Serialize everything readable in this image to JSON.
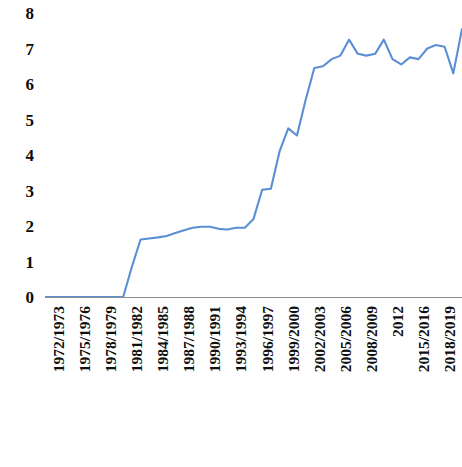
{
  "chart_data": {
    "type": "line",
    "title": "",
    "subtitle": "",
    "xlabel": "",
    "ylabel": "",
    "ylim": [
      0,
      8
    ],
    "y_ticks": [
      0,
      1,
      2,
      3,
      4,
      5,
      6,
      7,
      8
    ],
    "grid": false,
    "legend": false,
    "legend_position": "none",
    "line_color": "#5B8FD4",
    "axis_color": "#8E8E8E",
    "tick_label_color": "#101010",
    "x_tick_labels": [
      "1972/1973",
      "1975/1976",
      "1978/1979",
      "1981/1982",
      "1984/1985",
      "1987/1988",
      "1990/1991",
      "1993/1994",
      "1996/1997",
      "1999/2000",
      "2002/2003",
      "2005/2006",
      "2008/2009",
      "2012",
      "2015/2016",
      "2018/2019",
      "EXERCICE 2021-22"
    ],
    "categories": [
      "1972/1973",
      "1973/1974",
      "1974/1975",
      "1975/1976",
      "1976/1977",
      "1977/1978",
      "1978/1979",
      "1979/1980",
      "1980/1981",
      "1981/1982",
      "1982/1983",
      "1983/1984",
      "1984/1985",
      "1985/1986",
      "1986/1987",
      "1987/1988",
      "1988/1989",
      "1989/1990",
      "1990/1991",
      "1991/1992",
      "1992/1993",
      "1993/1994",
      "1994/1995",
      "1995/1996",
      "1996/1997",
      "1997/1998",
      "1998/1999",
      "1999/2000",
      "2000/2001",
      "2001/2002",
      "2002/2003",
      "2003/2004",
      "2004/2005",
      "2005/2006",
      "2006/2007",
      "2007/2008",
      "2008/2009",
      "2009/2010",
      "2010/2011",
      "2012",
      "2013/2014",
      "2014/2015",
      "2015/2016",
      "2016/2017",
      "2017/2018",
      "2018/2019",
      "2019/2020",
      "2020/2021",
      "EXERCICE 2021-22"
    ],
    "values": [
      0.0,
      0.0,
      0.0,
      0.0,
      0.0,
      0.0,
      0.0,
      0.0,
      0.0,
      0.0,
      0.85,
      1.62,
      1.65,
      1.68,
      1.72,
      1.8,
      1.88,
      1.95,
      1.98,
      1.98,
      1.92,
      1.9,
      1.95,
      1.95,
      2.2,
      3.02,
      3.05,
      4.1,
      4.75,
      4.55,
      5.55,
      6.45,
      6.5,
      6.7,
      6.8,
      7.25,
      6.85,
      6.8,
      6.85,
      7.25,
      6.7,
      6.55,
      6.75,
      6.7,
      7.0,
      7.1,
      7.05,
      6.3,
      7.55
    ],
    "series": [
      {
        "name": "",
        "color": "#5B8FD4",
        "values": [
          0.0,
          0.0,
          0.0,
          0.0,
          0.0,
          0.0,
          0.0,
          0.0,
          0.0,
          0.0,
          0.85,
          1.62,
          1.65,
          1.68,
          1.72,
          1.8,
          1.88,
          1.95,
          1.98,
          1.98,
          1.92,
          1.9,
          1.95,
          1.95,
          2.2,
          3.02,
          3.05,
          4.1,
          4.75,
          4.55,
          5.55,
          6.45,
          6.5,
          6.7,
          6.8,
          7.25,
          6.85,
          6.8,
          6.85,
          7.25,
          6.7,
          6.55,
          6.75,
          6.7,
          7.0,
          7.1,
          7.05,
          6.3,
          7.55
        ]
      }
    ]
  }
}
